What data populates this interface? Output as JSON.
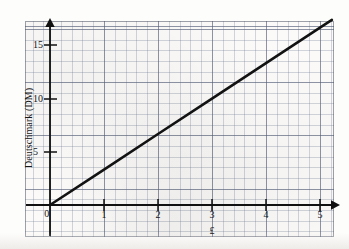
{
  "chart_data": {
    "type": "line",
    "title": "",
    "subtitle": "",
    "xlabel": "£",
    "ylabel": "Deutschmark (DM)",
    "xlim": [
      -0.46,
      5.26
    ],
    "ylim": [
      -3.0,
      17.35
    ],
    "x_ticks": [
      0,
      1,
      2,
      3,
      4,
      5
    ],
    "x_tick_labels": [
      "0",
      "1",
      "2",
      "3",
      "4",
      "5"
    ],
    "y_ticks": [
      5,
      10,
      15
    ],
    "y_tick_labels": [
      "5",
      "10",
      "15"
    ],
    "origin_label": "0",
    "grid": true,
    "grid_minor": true,
    "legend": "none",
    "series": [
      {
        "name": "Pounds to Deutschmarks conversion",
        "slope": 3.33,
        "intercept": 0,
        "x": [
          0,
          1,
          2,
          3,
          4,
          5,
          5.22
        ],
        "values": [
          0,
          3.33,
          6.67,
          10.0,
          13.33,
          16.67,
          17.4
        ],
        "color": "#121212",
        "line_width": 2.6
      }
    ],
    "annotations": [],
    "x_axis_arrow": true,
    "y_axis_arrow": true,
    "axis_color": "#111111"
  },
  "colors": {
    "paper": "#fbfaf8",
    "grid_major": "#5a6478",
    "grid_minor": "#6e7891",
    "ink": "#121212"
  }
}
